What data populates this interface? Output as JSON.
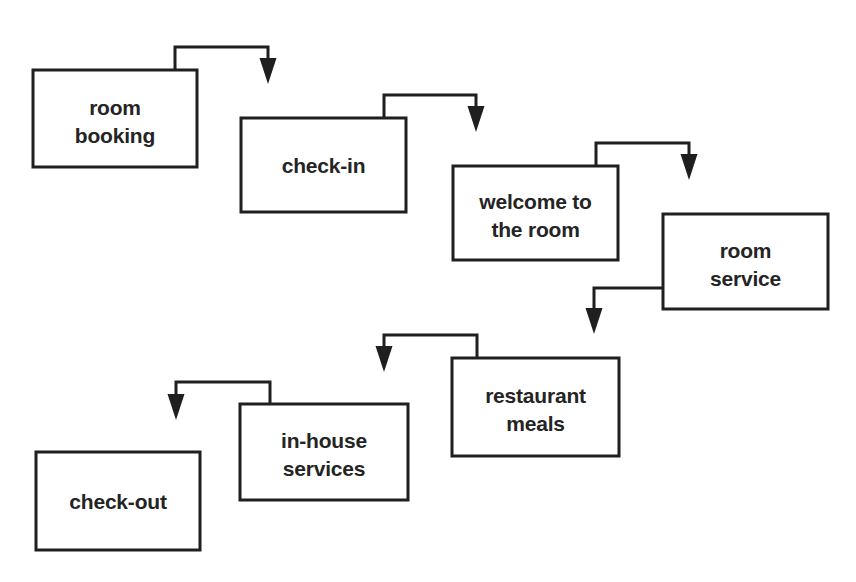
{
  "diagram": {
    "type": "flowchart",
    "title": "",
    "orientation": "left-to-right cascading, then right-to-left return",
    "background_color": "#ffffff",
    "line_color": "#1f1f1f",
    "text_color": "#242424",
    "nodes": [
      {
        "id": "room-booking",
        "label_line1": "room",
        "label_line2": "booking",
        "x": 33,
        "y": 70,
        "w": 164,
        "h": 97
      },
      {
        "id": "check-in",
        "label_line1": "check-in",
        "label_line2": "",
        "x": 241,
        "y": 118,
        "w": 165,
        "h": 94
      },
      {
        "id": "welcome-to-the-room",
        "label_line1": "welcome to",
        "label_line2": "the room",
        "x": 453,
        "y": 166,
        "w": 165,
        "h": 94
      },
      {
        "id": "room-service",
        "label_line1": "room",
        "label_line2": "service",
        "x": 663,
        "y": 214,
        "w": 165,
        "h": 95
      },
      {
        "id": "restaurant-meals",
        "label_line1": "restaurant",
        "label_line2": "meals",
        "x": 452,
        "y": 358,
        "w": 167,
        "h": 98
      },
      {
        "id": "in-house-services",
        "label_line1": "in-house",
        "label_line2": "services",
        "x": 240,
        "y": 404,
        "w": 168,
        "h": 96
      },
      {
        "id": "check-out",
        "label_line1": "check-out",
        "label_line2": "",
        "x": 36,
        "y": 452,
        "w": 164,
        "h": 98
      }
    ],
    "connectors": [
      {
        "id": "room-booking-to-check-in",
        "from": "room-booking",
        "to": "check-in",
        "path": "M 175 70 L 175 47 L 268 47 L 268 68",
        "arrow_tip_x": 268,
        "arrow_tip_y": 84,
        "arrow_dir": "down"
      },
      {
        "id": "check-in-to-welcome-to-the-room",
        "from": "check-in",
        "to": "welcome-to-the-room",
        "path": "M 384 118 L 384 95 L 476 95 L 476 116",
        "arrow_tip_x": 476,
        "arrow_tip_y": 132,
        "arrow_dir": "down"
      },
      {
        "id": "welcome-to-the-room-to-room-service",
        "from": "welcome-to-the-room",
        "to": "room-service",
        "path": "M 596 166 L 596 143 L 689 143 L 689 164",
        "arrow_tip_x": 689,
        "arrow_tip_y": 180,
        "arrow_dir": "down"
      },
      {
        "id": "room-service-to-restaurant-meals",
        "from": "room-service",
        "to": "restaurant-meals",
        "path": "M 663 288 L 594 288 L 594 318",
        "arrow_tip_x": 594,
        "arrow_tip_y": 334,
        "arrow_dir": "down"
      },
      {
        "id": "restaurant-meals-to-in-house-services",
        "from": "restaurant-meals",
        "to": "in-house-services",
        "path": "M 477 358 L 477 335 L 384 335 L 384 356",
        "arrow_tip_x": 384,
        "arrow_tip_y": 372,
        "arrow_dir": "down"
      },
      {
        "id": "in-house-services-to-check-out",
        "from": "in-house-services",
        "to": "check-out",
        "path": "M 270 404 L 270 382 L 176 382 L 176 404",
        "arrow_tip_x": 176,
        "arrow_tip_y": 420,
        "arrow_dir": "down"
      }
    ]
  }
}
